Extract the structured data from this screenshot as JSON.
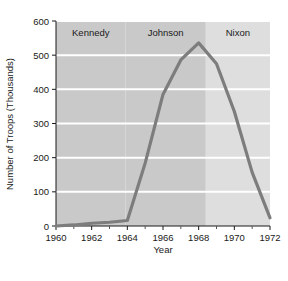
{
  "chart_data": {
    "type": "line",
    "title": "",
    "xlabel": "Year",
    "ylabel": "Number of Troops (Thousands)",
    "xlim": [
      1960,
      1972
    ],
    "ylim": [
      0,
      600
    ],
    "grid": "horizontal",
    "legend": "none",
    "line_color": "#7d7d7d",
    "plot_bg_color": "#c9c9c9",
    "plot_bg_color_light": "#dedede",
    "gridline_color": "#ffffff",
    "x": [
      1960,
      1961,
      1962,
      1963,
      1964,
      1965,
      1966,
      1967,
      1968,
      1969,
      1970,
      1971,
      1972
    ],
    "values": [
      0,
      3,
      8,
      11,
      16,
      184,
      385,
      486,
      536,
      475,
      335,
      157,
      24
    ],
    "xticks": [
      1960,
      1962,
      1964,
      1966,
      1968,
      1970,
      1972
    ],
    "xtick_labels": [
      "1960",
      "1962",
      "1964",
      "1966",
      "1968",
      "1970",
      "1972"
    ],
    "xminor_ticks": [
      1961,
      1963,
      1965,
      1967,
      1969,
      1971
    ],
    "yticks": [
      0,
      100,
      200,
      300,
      400,
      500,
      600
    ],
    "ytick_labels": [
      "0",
      "100",
      "200",
      "300",
      "400",
      "500",
      "600"
    ],
    "annotations": [
      {
        "name": "kennedy",
        "label": "Kennedy",
        "x_start": 1960,
        "x_end": 1963.9,
        "shade": "#c9c9c9"
      },
      {
        "name": "johnson",
        "label": "Johnson",
        "x_start": 1963.9,
        "x_end": 1968.4,
        "shade": "#c9c9c9"
      },
      {
        "name": "nixon",
        "label": "Nixon",
        "x_start": 1968.4,
        "x_end": 1972,
        "shade": "#dedede"
      }
    ]
  }
}
